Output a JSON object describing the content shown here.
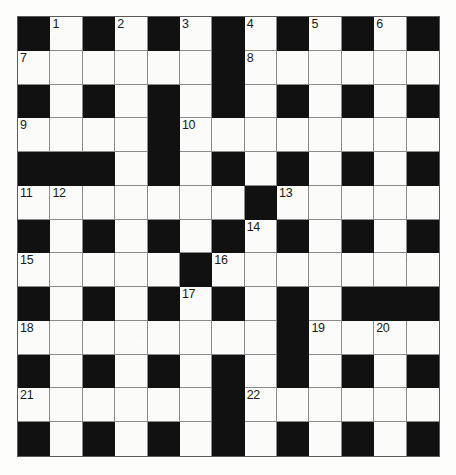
{
  "puzzle": {
    "type": "crossword-grid",
    "rows": 13,
    "columns": 13,
    "colors": {
      "block": "#111111",
      "cell": "#fbfbfa",
      "grid_line": "#8c8c8c",
      "border": "#5a5a5a",
      "number_text": "#1a1a1a",
      "paper": "#fdfdfc"
    },
    "clue_numbers_present": [
      1,
      2,
      3,
      4,
      5,
      6,
      7,
      8,
      9,
      10,
      11,
      12,
      13,
      14,
      15,
      16,
      17,
      18,
      19,
      20,
      21,
      22
    ],
    "grid": [
      [
        {
          "type": "block"
        },
        {
          "type": "cell",
          "number": "1"
        },
        {
          "type": "block"
        },
        {
          "type": "cell",
          "number": "2"
        },
        {
          "type": "block"
        },
        {
          "type": "cell",
          "number": "3"
        },
        {
          "type": "block"
        },
        {
          "type": "cell",
          "number": "4"
        },
        {
          "type": "block"
        },
        {
          "type": "cell",
          "number": "5"
        },
        {
          "type": "block"
        },
        {
          "type": "cell",
          "number": "6"
        },
        {
          "type": "block"
        }
      ],
      [
        {
          "type": "cell",
          "number": "7"
        },
        {
          "type": "cell"
        },
        {
          "type": "cell"
        },
        {
          "type": "cell"
        },
        {
          "type": "cell"
        },
        {
          "type": "cell"
        },
        {
          "type": "block"
        },
        {
          "type": "cell",
          "number": "8"
        },
        {
          "type": "cell"
        },
        {
          "type": "cell"
        },
        {
          "type": "cell"
        },
        {
          "type": "cell"
        },
        {
          "type": "cell"
        }
      ],
      [
        {
          "type": "block"
        },
        {
          "type": "cell"
        },
        {
          "type": "block"
        },
        {
          "type": "cell"
        },
        {
          "type": "block"
        },
        {
          "type": "cell"
        },
        {
          "type": "block"
        },
        {
          "type": "cell"
        },
        {
          "type": "block"
        },
        {
          "type": "cell"
        },
        {
          "type": "block"
        },
        {
          "type": "cell"
        },
        {
          "type": "block"
        }
      ],
      [
        {
          "type": "cell",
          "number": "9"
        },
        {
          "type": "cell"
        },
        {
          "type": "cell"
        },
        {
          "type": "cell"
        },
        {
          "type": "block"
        },
        {
          "type": "cell",
          "number": "10"
        },
        {
          "type": "cell"
        },
        {
          "type": "cell"
        },
        {
          "type": "cell"
        },
        {
          "type": "cell"
        },
        {
          "type": "cell"
        },
        {
          "type": "cell"
        },
        {
          "type": "cell"
        }
      ],
      [
        {
          "type": "block"
        },
        {
          "type": "block"
        },
        {
          "type": "block"
        },
        {
          "type": "cell"
        },
        {
          "type": "block"
        },
        {
          "type": "cell"
        },
        {
          "type": "block"
        },
        {
          "type": "cell"
        },
        {
          "type": "block"
        },
        {
          "type": "cell"
        },
        {
          "type": "block"
        },
        {
          "type": "cell"
        },
        {
          "type": "block"
        }
      ],
      [
        {
          "type": "cell",
          "number": "11"
        },
        {
          "type": "cell",
          "number": "12"
        },
        {
          "type": "cell"
        },
        {
          "type": "cell"
        },
        {
          "type": "cell"
        },
        {
          "type": "cell"
        },
        {
          "type": "cell"
        },
        {
          "type": "block"
        },
        {
          "type": "cell",
          "number": "13"
        },
        {
          "type": "cell"
        },
        {
          "type": "cell"
        },
        {
          "type": "cell"
        },
        {
          "type": "cell"
        }
      ],
      [
        {
          "type": "block"
        },
        {
          "type": "cell"
        },
        {
          "type": "block"
        },
        {
          "type": "cell"
        },
        {
          "type": "block"
        },
        {
          "type": "cell"
        },
        {
          "type": "block"
        },
        {
          "type": "cell",
          "number": "14"
        },
        {
          "type": "block"
        },
        {
          "type": "cell"
        },
        {
          "type": "block"
        },
        {
          "type": "cell"
        },
        {
          "type": "block"
        }
      ],
      [
        {
          "type": "cell",
          "number": "15"
        },
        {
          "type": "cell"
        },
        {
          "type": "cell"
        },
        {
          "type": "cell"
        },
        {
          "type": "cell"
        },
        {
          "type": "block"
        },
        {
          "type": "cell",
          "number": "16"
        },
        {
          "type": "cell"
        },
        {
          "type": "cell"
        },
        {
          "type": "cell"
        },
        {
          "type": "cell"
        },
        {
          "type": "cell"
        },
        {
          "type": "cell"
        }
      ],
      [
        {
          "type": "block"
        },
        {
          "type": "cell"
        },
        {
          "type": "block"
        },
        {
          "type": "cell"
        },
        {
          "type": "block"
        },
        {
          "type": "cell",
          "number": "17"
        },
        {
          "type": "block"
        },
        {
          "type": "cell"
        },
        {
          "type": "block"
        },
        {
          "type": "cell"
        },
        {
          "type": "block"
        },
        {
          "type": "block"
        },
        {
          "type": "block"
        }
      ],
      [
        {
          "type": "cell",
          "number": "18"
        },
        {
          "type": "cell"
        },
        {
          "type": "cell"
        },
        {
          "type": "cell"
        },
        {
          "type": "cell"
        },
        {
          "type": "cell"
        },
        {
          "type": "cell"
        },
        {
          "type": "cell"
        },
        {
          "type": "block"
        },
        {
          "type": "cell",
          "number": "19"
        },
        {
          "type": "cell"
        },
        {
          "type": "cell",
          "number": "20"
        },
        {
          "type": "cell"
        }
      ],
      [
        {
          "type": "block"
        },
        {
          "type": "cell"
        },
        {
          "type": "block"
        },
        {
          "type": "cell"
        },
        {
          "type": "block"
        },
        {
          "type": "cell"
        },
        {
          "type": "block"
        },
        {
          "type": "cell"
        },
        {
          "type": "block"
        },
        {
          "type": "cell"
        },
        {
          "type": "block"
        },
        {
          "type": "cell"
        },
        {
          "type": "block"
        }
      ],
      [
        {
          "type": "cell",
          "number": "21"
        },
        {
          "type": "cell"
        },
        {
          "type": "cell"
        },
        {
          "type": "cell"
        },
        {
          "type": "cell"
        },
        {
          "type": "cell"
        },
        {
          "type": "block"
        },
        {
          "type": "cell",
          "number": "22"
        },
        {
          "type": "cell"
        },
        {
          "type": "cell"
        },
        {
          "type": "cell"
        },
        {
          "type": "cell"
        },
        {
          "type": "cell"
        }
      ],
      [
        {
          "type": "block"
        },
        {
          "type": "cell"
        },
        {
          "type": "block"
        },
        {
          "type": "cell"
        },
        {
          "type": "block"
        },
        {
          "type": "cell"
        },
        {
          "type": "block"
        },
        {
          "type": "cell"
        },
        {
          "type": "block"
        },
        {
          "type": "cell"
        },
        {
          "type": "block"
        },
        {
          "type": "cell"
        },
        {
          "type": "block"
        }
      ]
    ]
  }
}
